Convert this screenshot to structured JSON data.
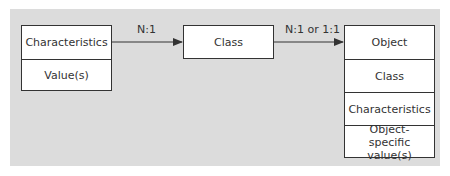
{
  "diagram": {
    "left_box": {
      "rows": [
        "Characteristics",
        "Value(s)"
      ]
    },
    "middle_box": {
      "rows": [
        "Class"
      ]
    },
    "right_box": {
      "rows": [
        "Object",
        "Class",
        "Characteristics",
        "Object-specific value(s)"
      ]
    },
    "arrows": [
      {
        "from": "left_box",
        "to": "middle_box",
        "label": "N:1"
      },
      {
        "from": "middle_box",
        "to": "right_box",
        "label": "N:1 or 1:1"
      }
    ]
  },
  "colors": {
    "panel_bg": "#dcdcdc",
    "box_bg": "#ffffff",
    "stroke": "#333333"
  }
}
